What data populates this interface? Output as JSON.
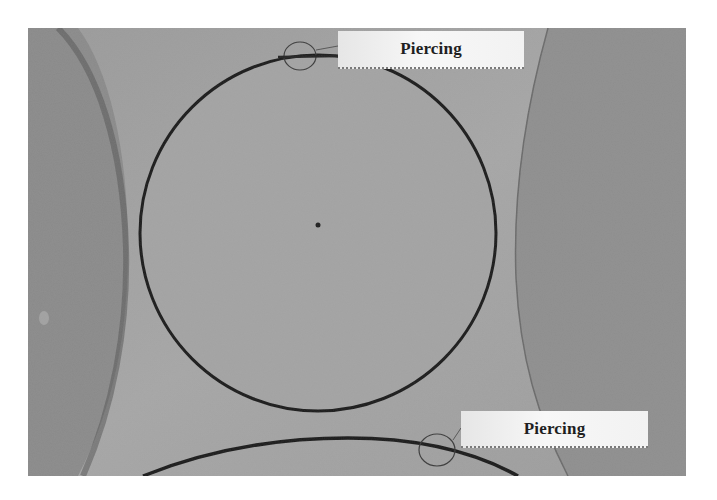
{
  "image": {
    "description": "Grayscale photograph of a laser-cut circular part on a sheet, with two callouts marking piercing points",
    "background_color": "#ffffff",
    "photo_tone": "#8c8c8c"
  },
  "callouts": [
    {
      "label": "Piercing",
      "position": "top"
    },
    {
      "label": "Piercing",
      "position": "bottom"
    }
  ]
}
